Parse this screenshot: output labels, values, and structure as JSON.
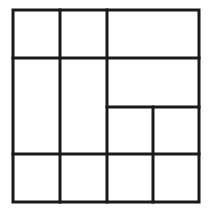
{
  "diagram": {
    "type": "grid-partition",
    "stroke_color": "#1a1a1a",
    "background": "#ffffff",
    "stroke_width": 3,
    "outer": {
      "x1": 13,
      "y1": 10,
      "x2": 199,
      "y2": 202
    },
    "lines": [
      {
        "id": "v1",
        "x1": 60,
        "y1": 10,
        "x2": 60,
        "y2": 202
      },
      {
        "id": "v2",
        "x1": 107,
        "y1": 10,
        "x2": 107,
        "y2": 202
      },
      {
        "id": "v3",
        "x1": 153,
        "y1": 107,
        "x2": 153,
        "y2": 202
      },
      {
        "id": "h1",
        "x1": 13,
        "y1": 58,
        "x2": 199,
        "y2": 58
      },
      {
        "id": "h2",
        "x1": 107,
        "y1": 107,
        "x2": 199,
        "y2": 107
      },
      {
        "id": "h3",
        "x1": 13,
        "y1": 154,
        "x2": 199,
        "y2": 154
      }
    ],
    "cell_count": 10
  }
}
